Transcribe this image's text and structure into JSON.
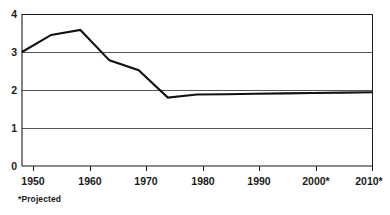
{
  "chart_data": {
    "type": "line",
    "title": "",
    "subtitle": "",
    "xlabel": "",
    "ylabel": "",
    "x": [
      1950,
      1955,
      1960,
      1965,
      1970,
      1975,
      1980,
      1985,
      1990,
      1995,
      2000,
      2005,
      2010
    ],
    "series": [
      {
        "name": "",
        "values": [
          3.0,
          3.45,
          3.58,
          2.78,
          2.52,
          1.8,
          1.88,
          1.89,
          1.9,
          1.91,
          1.92,
          1.93,
          1.94
        ]
      }
    ],
    "xlim": [
      1950,
      2010
    ],
    "ylim": [
      0,
      4
    ],
    "y_ticks": [
      "0",
      "1",
      "2",
      "3",
      "4"
    ],
    "y_tick_values": [
      0,
      1,
      2,
      3,
      4
    ],
    "x_ticks": [
      "1950",
      "1960",
      "1970",
      "1980",
      "1990",
      "2000*",
      "2010*"
    ],
    "x_tick_values": [
      1950,
      1960,
      1970,
      1980,
      1990,
      2000,
      2010
    ],
    "grid": "horizontal",
    "legend": "none",
    "annotations": [
      "*Projected"
    ],
    "line_color": "#111111",
    "grid_color": "#555555",
    "axis_color": "#1a1a1a",
    "background_color": "#ffffff"
  },
  "footnote": {
    "text": "*Projected"
  }
}
